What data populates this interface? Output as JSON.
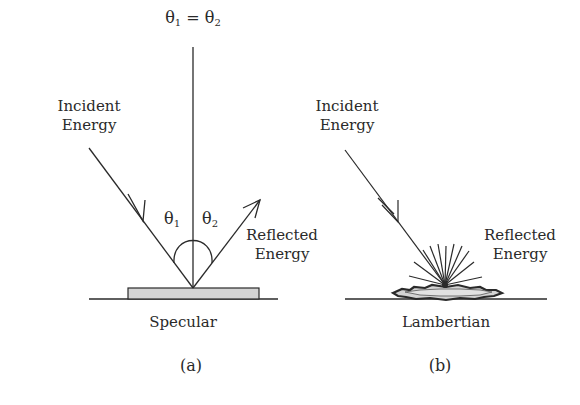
{
  "figure": {
    "panels": [
      {
        "id": "a",
        "panel_label": "(a)",
        "surface_label": "Specular",
        "incident_label_line1": "Incident",
        "incident_label_line2": "Energy",
        "reflected_label_line1": "Reflected",
        "reflected_label_line2": "Energy",
        "equation": {
          "left_symbol": "θ",
          "left_sub": "1",
          "equals": "=",
          "right_symbol": "θ",
          "right_sub": "2"
        },
        "angle1": {
          "symbol": "θ",
          "sub": "1"
        },
        "angle2": {
          "symbol": "θ",
          "sub": "2"
        }
      },
      {
        "id": "b",
        "panel_label": "(b)",
        "surface_label": "Lambertian",
        "incident_label_line1": "Incident",
        "incident_label_line2": "Energy",
        "reflected_label_line1": "Reflected",
        "reflected_label_line2": "Energy"
      }
    ],
    "colors": {
      "ink": "#2a2a2a",
      "surface_fill": "#d4d4d4",
      "background": "#ffffff"
    }
  }
}
